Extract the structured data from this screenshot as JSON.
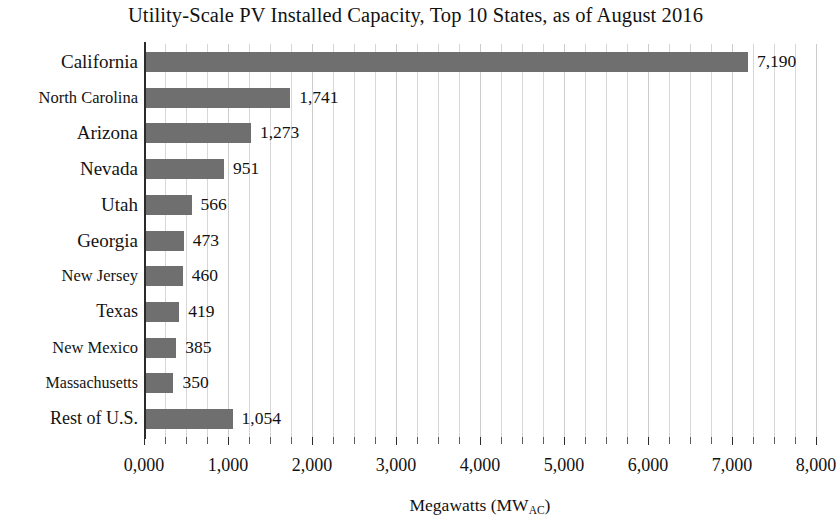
{
  "chart_data": {
    "type": "bar",
    "orientation": "horizontal",
    "title": "Utility-Scale PV Installed Capacity, Top 10 States, as of August 2016",
    "xlabel_text": "Megawatts (MW",
    "xlabel_sub": "AC",
    "xlabel_tail": ")",
    "ylabel": "",
    "xlim": [
      0,
      8000
    ],
    "grid": true,
    "grid_axis": "x",
    "grid_minor_step": 250,
    "legend": "none",
    "bar_color": "#6f6f6f",
    "categories": [
      "California",
      "North Carolina",
      "Arizona",
      "Nevada",
      "Utah",
      "Georgia",
      "New Jersey",
      "Texas",
      "New Mexico",
      "Massachusetts",
      "Rest of U.S."
    ],
    "values": [
      7190,
      1741,
      1273,
      951,
      566,
      473,
      460,
      419,
      385,
      350,
      1054
    ],
    "value_labels": [
      "7,190",
      "1,741",
      "1,273",
      "951",
      "566",
      "473",
      "460",
      "419",
      "385",
      "350",
      "1,054"
    ],
    "xticks": [
      0,
      1000,
      2000,
      3000,
      4000,
      5000,
      6000,
      7000,
      8000
    ],
    "xtick_labels": [
      "0,000",
      "1,000",
      "2,000",
      "3,000",
      "4,000",
      "5,000",
      "6,000",
      "7,000",
      "8,000"
    ],
    "category_label_sizes": [
      19,
      16.5,
      19,
      19,
      19,
      19,
      16.5,
      18,
      16.5,
      16,
      18
    ]
  }
}
